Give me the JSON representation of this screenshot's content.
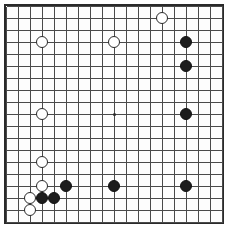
{
  "board": {
    "title": "Go board position",
    "game": "Go (Weiqi / Baduk)",
    "size": 19,
    "size_label": "19x19",
    "geometry": {
      "origin_x": 6,
      "origin_y": 6,
      "cell": 12,
      "stone_radius": 6.2,
      "hoshi_radius": 1.5,
      "border_width": 2,
      "line_width": 1
    },
    "colors": {
      "background": "#ffffff",
      "board_fill": "#fdfdfd",
      "line": "#4a4a4a",
      "border": "#2a2a2a",
      "black_stone": "#1c1c1c",
      "white_stone": "#ffffff",
      "white_stone_edge": "#2a2a2a"
    },
    "hoshi_points": [
      {
        "col": 9,
        "row": 9,
        "name": "tengen"
      }
    ],
    "stones": [
      {
        "color": "white",
        "col": 13,
        "row": 1,
        "label": "N18"
      },
      {
        "color": "white",
        "col": 3,
        "row": 3,
        "label": "D16"
      },
      {
        "color": "white",
        "col": 9,
        "row": 3,
        "label": "K16"
      },
      {
        "color": "black",
        "col": 15,
        "row": 3,
        "label": "Q16"
      },
      {
        "color": "black",
        "col": 15,
        "row": 5,
        "label": "Q14"
      },
      {
        "color": "white",
        "col": 3,
        "row": 9,
        "label": "D10"
      },
      {
        "color": "black",
        "col": 15,
        "row": 9,
        "label": "Q10"
      },
      {
        "color": "white",
        "col": 3,
        "row": 13,
        "label": "D6"
      },
      {
        "color": "white",
        "col": 3,
        "row": 15,
        "label": "D4"
      },
      {
        "color": "black",
        "col": 5,
        "row": 15,
        "label": "F4"
      },
      {
        "color": "black",
        "col": 9,
        "row": 15,
        "label": "K4"
      },
      {
        "color": "black",
        "col": 15,
        "row": 15,
        "label": "Q4"
      },
      {
        "color": "white",
        "col": 2,
        "row": 16,
        "label": "C3"
      },
      {
        "color": "black",
        "col": 3,
        "row": 16,
        "label": "D3"
      },
      {
        "color": "black",
        "col": 4,
        "row": 16,
        "label": "E3"
      },
      {
        "color": "white",
        "col": 2,
        "row": 17,
        "label": "C2"
      }
    ],
    "counts": {
      "black_stones": 8,
      "white_stones": 8,
      "total_stones": 16
    }
  }
}
